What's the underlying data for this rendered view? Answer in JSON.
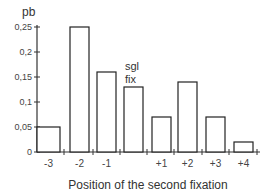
{
  "chart_data": {
    "type": "bar",
    "title": "",
    "xlabel": "Position of the second fixation",
    "ylabel": "pb",
    "ylim": [
      0,
      0.25
    ],
    "yticks": [
      0,
      0.05,
      0.1,
      0.15,
      0.2,
      0.25
    ],
    "ytick_labels": [
      "0",
      "0,05",
      "0,1",
      "0,15",
      "0,2",
      "0,25"
    ],
    "categories": [
      "-3",
      "-2",
      "-1",
      "sgl fix",
      "+1",
      "+2",
      "+3",
      "+4"
    ],
    "category_labels": [
      "-3",
      "-2",
      "-1",
      "",
      "+1",
      "+2",
      "+3",
      "+4"
    ],
    "values": [
      0.05,
      0.25,
      0.16,
      0.13,
      0.07,
      0.14,
      0.07,
      0.02
    ],
    "annotations": [
      {
        "text_lines": [
          "sgl",
          "fix"
        ],
        "category": "sgl fix"
      }
    ],
    "grid": false,
    "legend": "none",
    "colors": {
      "bar_fill": "#ffffff",
      "bar_stroke": "#222222",
      "axis": "#333333"
    }
  }
}
